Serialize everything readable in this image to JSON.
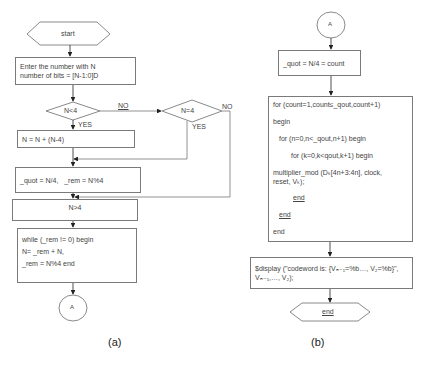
{
  "figure_a": {
    "caption": "(a)",
    "start_label": "start",
    "input_box": {
      "line1": "Enter the number with N",
      "line2": "number of bits = [N-1:0]D"
    },
    "decision1": {
      "label": "N<4",
      "no": "NO",
      "yes": "YES"
    },
    "decision2": {
      "label": "N=4",
      "no": "NO",
      "yes": "YES"
    },
    "adjust_box": "N = N + (N-4)",
    "quot_box": {
      "quot": "_quot = N/4,",
      "rem": "_rem = N%4"
    },
    "n_gt4_box": "N>4",
    "while_box": {
      "line1": "while (_rem != 0) begin",
      "line2": "N= _rem + N,",
      "line3": "_rem = N%4 end"
    },
    "connector": "A"
  },
  "figure_b": {
    "caption": "(b)",
    "connector": "A",
    "quot_box": "_quot = N/4 = count",
    "loop_box": {
      "line1": "for (count=1,count≤_qout,count+1)",
      "line2": "begin",
      "line3": "for (n=0,n<_qout,n+1)  begin",
      "line4": "for (k=0,k<qout,k+1)  begin",
      "line5": "multiplier_mod (Dₖ[4n+3:4n], clock,",
      "line6": "reset, Vₖ);",
      "line7": "end",
      "line8": "end",
      "line9": "end"
    },
    "display_box": {
      "line1": "$display (\"codeword is: {Vₙ₋₁=%b…, V₂=%b}\",",
      "line2": "Vₙ₋₁,…, V₂);"
    },
    "end_label": "end"
  }
}
